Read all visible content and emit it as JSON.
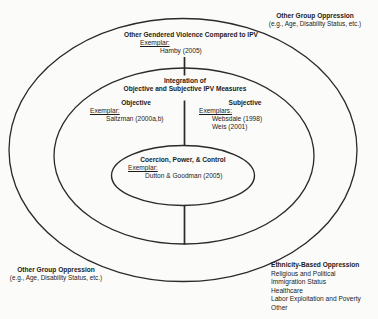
{
  "diagram": {
    "top_right_oppression": {
      "title": "Other Group Oppression",
      "subtitle": "(e.g., Age, Disability Status, etc.)"
    },
    "gendered_ring": {
      "title": "Other Gendered Violence Compared to IPV",
      "exemplar_label": "Exemplar:",
      "exemplar": "Hamby (2005)"
    },
    "integration_ring": {
      "title_line1": "Integration of",
      "title_line2": "Objective and Subjective IPV Measures"
    },
    "objective": {
      "title": "Objective",
      "exemplar_label": "Exemplar:",
      "exemplar": "Saltzman (2000a,b)"
    },
    "subjective": {
      "title": "Subjective",
      "exemplar_label": "Exemplars:",
      "exemplars": [
        "Websdale (1998)",
        "Weis (2001)"
      ]
    },
    "core": {
      "title": "Coercion, Power, & Control",
      "exemplar_label": "Exemplar:",
      "exemplar": "Dutton & Goodman (2005)"
    },
    "bottom_left_oppression": {
      "title": "Other Group Oppression",
      "subtitle": "(e.g., Age, Disability Status, etc.)"
    },
    "ethnicity_oppression": {
      "title": "Ethnicity-Based Oppression",
      "items": [
        "Religious and Political",
        "Immigration Status",
        "Healthcare",
        "Labor Exploitation and Poverty",
        "Other"
      ]
    }
  },
  "colors": {
    "background": "#fbfbf9",
    "line": "#2a2a2a",
    "text": "#1b1b1b"
  }
}
